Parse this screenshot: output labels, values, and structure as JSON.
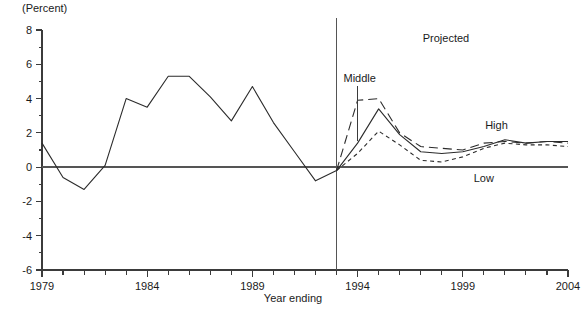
{
  "chart_data": {
    "type": "line",
    "title": "",
    "unit_label": "(Percent)",
    "xlabel": "Year ending",
    "ylabel": "",
    "xlim": [
      1979,
      2004
    ],
    "ylim": [
      -6,
      8
    ],
    "ytick_major": [
      8,
      6,
      4,
      2,
      0,
      -2,
      -4,
      -6
    ],
    "ytick_minor": [
      7,
      5,
      3,
      1,
      -1,
      -3,
      -5
    ],
    "ytick_labels": [
      "8",
      "6",
      "4",
      "2",
      "0",
      "-2",
      "-4",
      "-6"
    ],
    "xtick_labels": [
      "1979",
      "1984",
      "1989",
      "1994",
      "1999",
      "2004"
    ],
    "xtick_label_years": [
      1979,
      1984,
      1989,
      1994,
      1999,
      2004
    ],
    "xtick_every": 1,
    "grid": false,
    "legend_position": "inline-annotations",
    "projection_divider_year": 1993,
    "annotations": [
      {
        "text": "Projected",
        "x": 1998.2,
        "y": 7.3
      },
      {
        "text": "Middle",
        "x": 1994.1,
        "y": 4.95
      },
      {
        "text": "High",
        "x": 2000.6,
        "y": 2.25
      },
      {
        "text": "Low",
        "x": 2000.0,
        "y": -0.85
      }
    ],
    "series": [
      {
        "name": "Historical",
        "style": "solid",
        "x": [
          1979,
          1980,
          1981,
          1982,
          1983,
          1984,
          1985,
          1986,
          1987,
          1988,
          1989,
          1990,
          1991,
          1992,
          1993
        ],
        "values": [
          1.4,
          -0.6,
          -1.3,
          0.1,
          4.0,
          3.5,
          5.3,
          5.3,
          4.1,
          2.7,
          4.7,
          2.6,
          0.9,
          -0.8,
          -0.2
        ]
      },
      {
        "name": "Middle",
        "style": "solid",
        "x": [
          1993,
          1994,
          1995,
          1996,
          1997,
          1998,
          1999,
          2000,
          2001,
          2002,
          2003,
          2004
        ],
        "values": [
          -0.2,
          1.4,
          3.4,
          1.9,
          0.9,
          0.8,
          0.9,
          1.2,
          1.6,
          1.4,
          1.5,
          1.5
        ]
      },
      {
        "name": "High",
        "style": "long-dash",
        "x": [
          1993,
          1994,
          1995,
          1996,
          1997,
          1998,
          1999,
          2000,
          2001,
          2002,
          2003,
          2004
        ],
        "values": [
          -0.2,
          3.9,
          4.0,
          2.0,
          1.2,
          1.1,
          1.0,
          1.4,
          1.5,
          1.4,
          1.5,
          1.4
        ]
      },
      {
        "name": "Low",
        "style": "short-dash",
        "x": [
          1993,
          1994,
          1995,
          1996,
          1997,
          1998,
          1999,
          2000,
          2001,
          2002,
          2003,
          2004
        ],
        "values": [
          -0.2,
          0.8,
          2.1,
          1.3,
          0.4,
          0.3,
          0.6,
          1.1,
          1.4,
          1.3,
          1.3,
          1.2
        ]
      }
    ]
  }
}
